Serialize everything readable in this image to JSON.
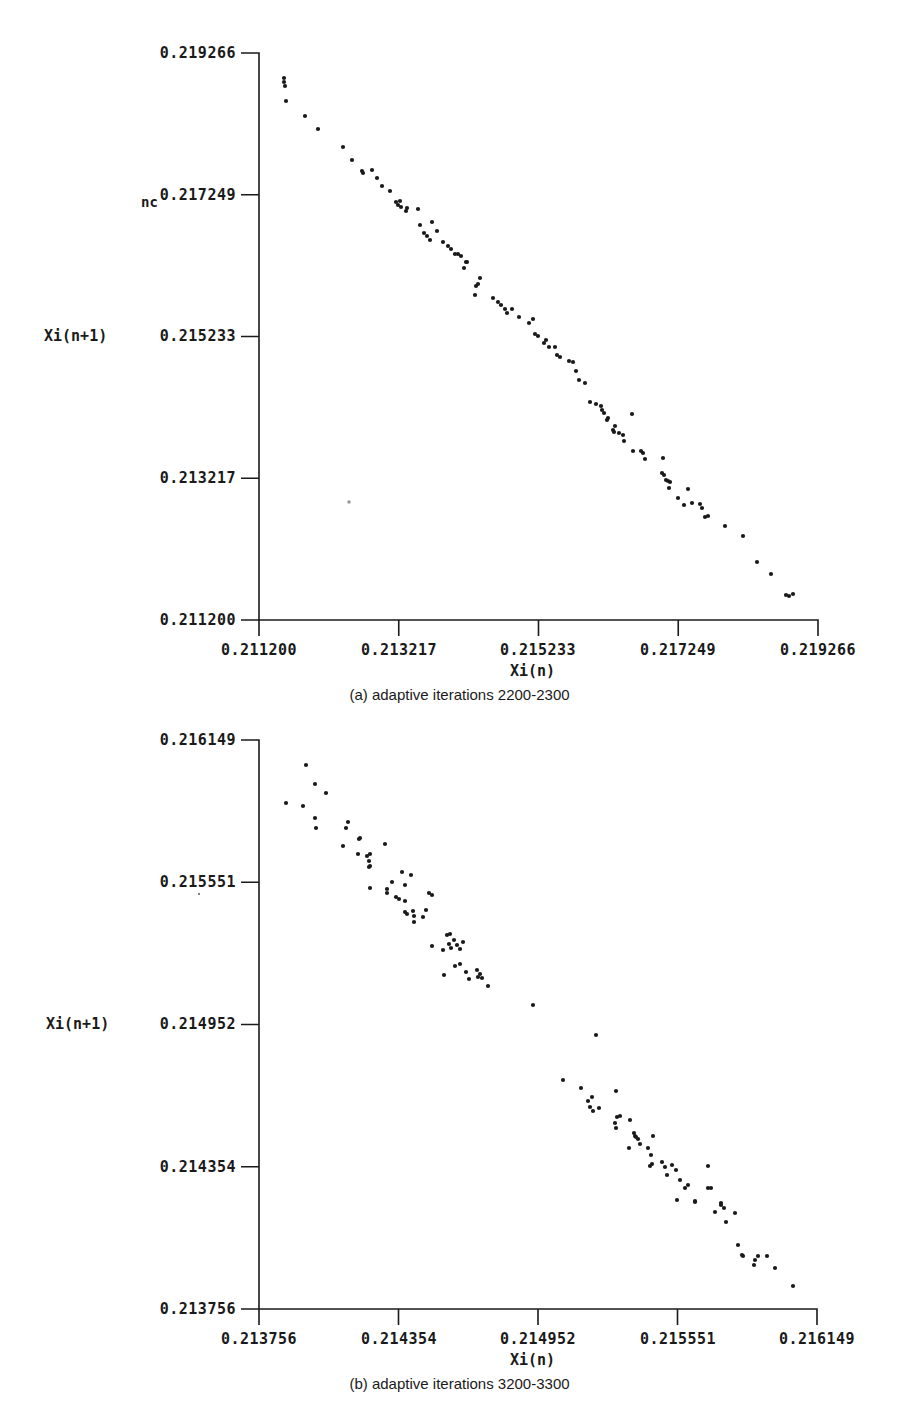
{
  "chart_data": [
    {
      "type": "scatter",
      "id": "a",
      "title": "(a) adaptive iterations 2200-2300",
      "xlabel": "Xi(n)",
      "ylabel": "Xi(n+1)",
      "xlim": [
        0.2112,
        0.219266
      ],
      "ylim": [
        0.2112,
        0.219266
      ],
      "xticks": [
        "0.211200",
        "0.213217",
        "0.215233",
        "0.217249",
        "0.219266"
      ],
      "yticks": [
        "0.211200",
        "0.213217",
        "0.215233",
        "0.217249",
        "0.219266"
      ],
      "ytick_display": [
        "0.211200",
        "0.213217",
        "0.215233",
        "0.217249",
        "0.219266"
      ],
      "annotation": "nc",
      "grid": false,
      "legend": null,
      "pixel_frame": {
        "x0": 259,
        "x1": 818,
        "y0": 620,
        "y1": 53
      },
      "points_px": [
        [
          284,
          78
        ],
        [
          284,
          82
        ],
        [
          285,
          86
        ],
        [
          286,
          101
        ],
        [
          305,
          116
        ],
        [
          318,
          129
        ],
        [
          343,
          147
        ],
        [
          352,
          160
        ],
        [
          362,
          171
        ],
        [
          363,
          173
        ],
        [
          372,
          170
        ],
        [
          377,
          178
        ],
        [
          382,
          186
        ],
        [
          390,
          191
        ],
        [
          396,
          202
        ],
        [
          398,
          205
        ],
        [
          400,
          201
        ],
        [
          401,
          207
        ],
        [
          406,
          211
        ],
        [
          407,
          208
        ],
        [
          418,
          209
        ],
        [
          420,
          225
        ],
        [
          424,
          233
        ],
        [
          427,
          236
        ],
        [
          430,
          240
        ],
        [
          432,
          222
        ],
        [
          437,
          231
        ],
        [
          443,
          242
        ],
        [
          448,
          246
        ],
        [
          451,
          249
        ],
        [
          455,
          254
        ],
        [
          458,
          254
        ],
        [
          461,
          256
        ],
        [
          464,
          268
        ],
        [
          466,
          262
        ],
        [
          467,
          262
        ],
        [
          476,
          286
        ],
        [
          475,
          295
        ],
        [
          478,
          284
        ],
        [
          480,
          278
        ],
        [
          493,
          298
        ],
        [
          498,
          302
        ],
        [
          501,
          305
        ],
        [
          505,
          309
        ],
        [
          507,
          313
        ],
        [
          512,
          309
        ],
        [
          519,
          317
        ],
        [
          529,
          323
        ],
        [
          533,
          319
        ],
        [
          535,
          334
        ],
        [
          538,
          336
        ],
        [
          546,
          340
        ],
        [
          544,
          343
        ],
        [
          549,
          347
        ],
        [
          555,
          347
        ],
        [
          557,
          355
        ],
        [
          560,
          357
        ],
        [
          569,
          361
        ],
        [
          573,
          362
        ],
        [
          576,
          371
        ],
        [
          579,
          380
        ],
        [
          585,
          383
        ],
        [
          590,
          402
        ],
        [
          596,
          404
        ],
        [
          601,
          406
        ],
        [
          602,
          410
        ],
        [
          604,
          413
        ],
        [
          607,
          420
        ],
        [
          608,
          418
        ],
        [
          613,
          430
        ],
        [
          614,
          432
        ],
        [
          615,
          426
        ],
        [
          619,
          433
        ],
        [
          623,
          435
        ],
        [
          624,
          441
        ],
        [
          632,
          414
        ],
        [
          633,
          451
        ],
        [
          641,
          451
        ],
        [
          643,
          453
        ],
        [
          645,
          459
        ],
        [
          662,
          473
        ],
        [
          664,
          475
        ],
        [
          666,
          480
        ],
        [
          668,
          481
        ],
        [
          663,
          458
        ],
        [
          670,
          482
        ],
        [
          669,
          488
        ],
        [
          678,
          498
        ],
        [
          688,
          489
        ],
        [
          684,
          505
        ],
        [
          692,
          503
        ],
        [
          700,
          504
        ],
        [
          702,
          508
        ],
        [
          705,
          517
        ],
        [
          708,
          516
        ],
        [
          725,
          526
        ],
        [
          743,
          536
        ],
        [
          757,
          562
        ],
        [
          771,
          574
        ],
        [
          786,
          595
        ],
        [
          789,
          596
        ],
        [
          793,
          594
        ]
      ],
      "note": "Points cluster tightly along a line of slope ≈ -1 from (≈0.2114, ≈0.2189) to (≈0.2188, ≈0.2113)."
    },
    {
      "type": "scatter",
      "id": "b",
      "title": "(b) adaptive iterations 3200-3300",
      "xlabel": "Xi(n)",
      "ylabel": "Xi(n+1)",
      "xlim": [
        0.213756,
        0.216149
      ],
      "ylim": [
        0.213756,
        0.216149
      ],
      "xticks": [
        "0.213756",
        "0.214354",
        "0.214952",
        "0.215551",
        "0.216149"
      ],
      "yticks": [
        "0.213756",
        "0.214354",
        "0.214952",
        "0.215551",
        "0.216149"
      ],
      "grid": false,
      "legend": null,
      "pixel_frame": {
        "x0": 259,
        "x1": 817,
        "y0": 1309,
        "y1": 740
      },
      "points_px": [
        [
          286,
          803
        ],
        [
          306,
          765
        ],
        [
          303,
          806
        ],
        [
          315,
          784
        ],
        [
          315,
          818
        ],
        [
          316,
          828
        ],
        [
          326,
          793
        ],
        [
          343,
          846
        ],
        [
          348,
          822
        ],
        [
          346,
          828
        ],
        [
          359,
          839
        ],
        [
          360,
          838
        ],
        [
          358,
          854
        ],
        [
          367,
          856
        ],
        [
          369,
          861
        ],
        [
          369,
          867
        ],
        [
          370,
          854
        ],
        [
          370,
          866
        ],
        [
          370,
          888
        ],
        [
          385,
          844
        ],
        [
          387,
          889
        ],
        [
          387,
          893
        ],
        [
          392,
          882
        ],
        [
          396,
          897
        ],
        [
          399,
          899
        ],
        [
          402,
          872
        ],
        [
          405,
          885
        ],
        [
          405,
          901
        ],
        [
          405,
          912
        ],
        [
          407,
          914
        ],
        [
          411,
          875
        ],
        [
          413,
          911
        ],
        [
          414,
          916
        ],
        [
          414,
          922
        ],
        [
          423,
          917
        ],
        [
          426,
          910
        ],
        [
          429,
          893
        ],
        [
          432,
          895
        ],
        [
          432,
          946
        ],
        [
          443,
          950
        ],
        [
          447,
          935
        ],
        [
          449,
          944
        ],
        [
          450,
          934
        ],
        [
          451,
          948
        ],
        [
          454,
          940
        ],
        [
          457,
          945
        ],
        [
          460,
          949
        ],
        [
          455,
          966
        ],
        [
          460,
          964
        ],
        [
          463,
          942
        ],
        [
          444,
          975
        ],
        [
          466,
          972
        ],
        [
          469,
          979
        ],
        [
          477,
          970
        ],
        [
          478,
          977
        ],
        [
          480,
          974
        ],
        [
          482,
          978
        ],
        [
          488,
          986
        ],
        [
          533,
          1005
        ],
        [
          563,
          1080
        ],
        [
          596,
          1035
        ],
        [
          581,
          1088
        ],
        [
          592,
          1097
        ],
        [
          588,
          1101
        ],
        [
          590,
          1107
        ],
        [
          593,
          1111
        ],
        [
          599,
          1108
        ],
        [
          616,
          1091
        ],
        [
          616,
          1128
        ],
        [
          615,
          1123
        ],
        [
          617,
          1117
        ],
        [
          620,
          1116
        ],
        [
          630,
          1120
        ],
        [
          629,
          1148
        ],
        [
          634,
          1133
        ],
        [
          635,
          1136
        ],
        [
          636,
          1137
        ],
        [
          640,
          1144
        ],
        [
          638,
          1139
        ],
        [
          648,
          1148
        ],
        [
          651,
          1155
        ],
        [
          652,
          1164
        ],
        [
          650,
          1166
        ],
        [
          653,
          1136
        ],
        [
          662,
          1162
        ],
        [
          665,
          1167
        ],
        [
          667,
          1175
        ],
        [
          676,
          1170
        ],
        [
          672,
          1165
        ],
        [
          680,
          1180
        ],
        [
          677,
          1200
        ],
        [
          685,
          1188
        ],
        [
          688,
          1185
        ],
        [
          695,
          1202
        ],
        [
          695,
          1201
        ],
        [
          708,
          1188
        ],
        [
          708,
          1166
        ],
        [
          711,
          1188
        ],
        [
          715,
          1212
        ],
        [
          721,
          1205
        ],
        [
          721,
          1203
        ],
        [
          724,
          1208
        ],
        [
          726,
          1222
        ],
        [
          735,
          1213
        ],
        [
          738,
          1245
        ],
        [
          742,
          1255
        ],
        [
          743,
          1256
        ],
        [
          755,
          1260
        ],
        [
          754,
          1265
        ],
        [
          758,
          1256
        ],
        [
          767,
          1256
        ],
        [
          775,
          1268
        ],
        [
          793,
          1286
        ]
      ],
      "note": "Points form two elongated clusters along a slope ≈ -1 line, separated by a sparse gap around Xi(n)≈0.2149."
    }
  ],
  "charts": {
    "a": {
      "ylabel": "Xi(n+1)",
      "xlabel": "Xi(n)",
      "caption": "(a) adaptive iterations 2200-2300",
      "yticks": [
        "0.219266",
        "0.217249",
        "0.215233",
        "0.213217",
        "0.211200"
      ],
      "xticks": [
        "0.211200",
        "0.213217",
        "0.215233",
        "0.217249",
        "0.219266"
      ],
      "stray_label": "nc"
    },
    "b": {
      "ylabel": "Xi(n+1)",
      "xlabel": "Xi(n)",
      "caption": "(b) adaptive iterations 3200-3300",
      "yticks": [
        "0.216149",
        "0.215551",
        "0.214952",
        "0.214354",
        "0.213756"
      ],
      "xticks": [
        "0.213756",
        "0.214354",
        "0.214952",
        "0.215551",
        "0.216149"
      ]
    }
  },
  "colors": {
    "ink": "#1a1a1a",
    "background": "#ffffff",
    "faint_dot": "#9a9a9a"
  }
}
